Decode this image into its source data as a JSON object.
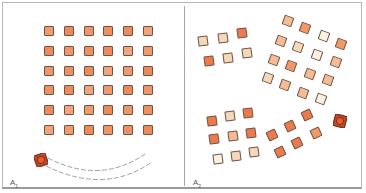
{
  "figure": {
    "panels": [
      {
        "id": "A1",
        "label_main": "A",
        "label_sub": "1",
        "arrangement": "6x6 regular grid",
        "rows": 6,
        "cols": 6,
        "robot": {
          "x": 41,
          "y": 160,
          "body_color": "#c04a25",
          "wheel_color": "#e8542a"
        },
        "trajectory": "two dashed arcs curving from robot toward right"
      },
      {
        "id": "A2",
        "label_main": "A",
        "label_sub": "2",
        "arrangement": "rearranged clusters",
        "robot": {
          "x": 340,
          "y": 121,
          "body_color": "#c04a25",
          "wheel_color": "#e8542a"
        }
      }
    ],
    "colors": {
      "dark": "#ec7a4d",
      "medium": "#f19868",
      "peach": "#f4bb94",
      "light": "#f6d8b8",
      "very_light": "#fbf0e2",
      "grid_fill": "#ef8e62",
      "border": "#6e5446",
      "frame": "#b9b9b9"
    }
  }
}
